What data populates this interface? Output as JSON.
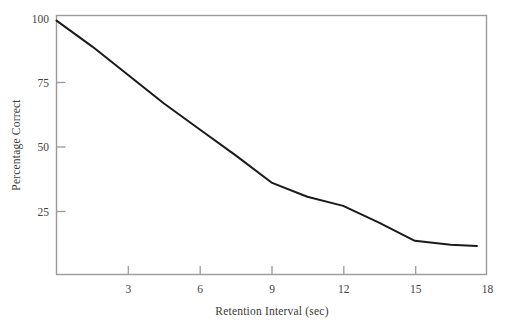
{
  "chart_data": {
    "type": "line",
    "title": "",
    "xlabel": "Retention Interval (sec)",
    "ylabel": "Percentage Correct",
    "xlim": [
      0,
      18
    ],
    "ylim": [
      0,
      100
    ],
    "xticks": [
      3,
      6,
      9,
      12,
      15,
      18
    ],
    "xtick_labels": [
      "3",
      "6",
      "9",
      "12",
      "15",
      "18"
    ],
    "yticks": [
      25,
      50,
      75,
      100
    ],
    "ytick_labels": [
      "25",
      "50",
      "75",
      "100"
    ],
    "grid": false,
    "legend": false,
    "frame": "box",
    "series": [
      {
        "name": "Percentage Correct",
        "color": "#1a1a1a",
        "line_width": 2,
        "x": [
          0,
          1.5,
          3,
          4.5,
          6,
          7.5,
          9,
          10.5,
          12,
          13.5,
          15,
          16.5,
          17.6
        ],
        "values": [
          98,
          88,
          77,
          66,
          56,
          46,
          35.5,
          30,
          26.5,
          20,
          13,
          11.5,
          11
        ]
      }
    ]
  },
  "axes": {
    "x_title": "Retention Interval (sec)",
    "y_title": "Percentage Correct",
    "x_tick_labels": [
      "3",
      "6",
      "9",
      "12",
      "15",
      "18"
    ],
    "y_tick_labels": [
      "25",
      "50",
      "75",
      "100"
    ]
  },
  "colors": {
    "line": "#1a1a1a",
    "frame": "#9a9a9a",
    "text": "#3a3a3a",
    "background": "#ffffff"
  }
}
